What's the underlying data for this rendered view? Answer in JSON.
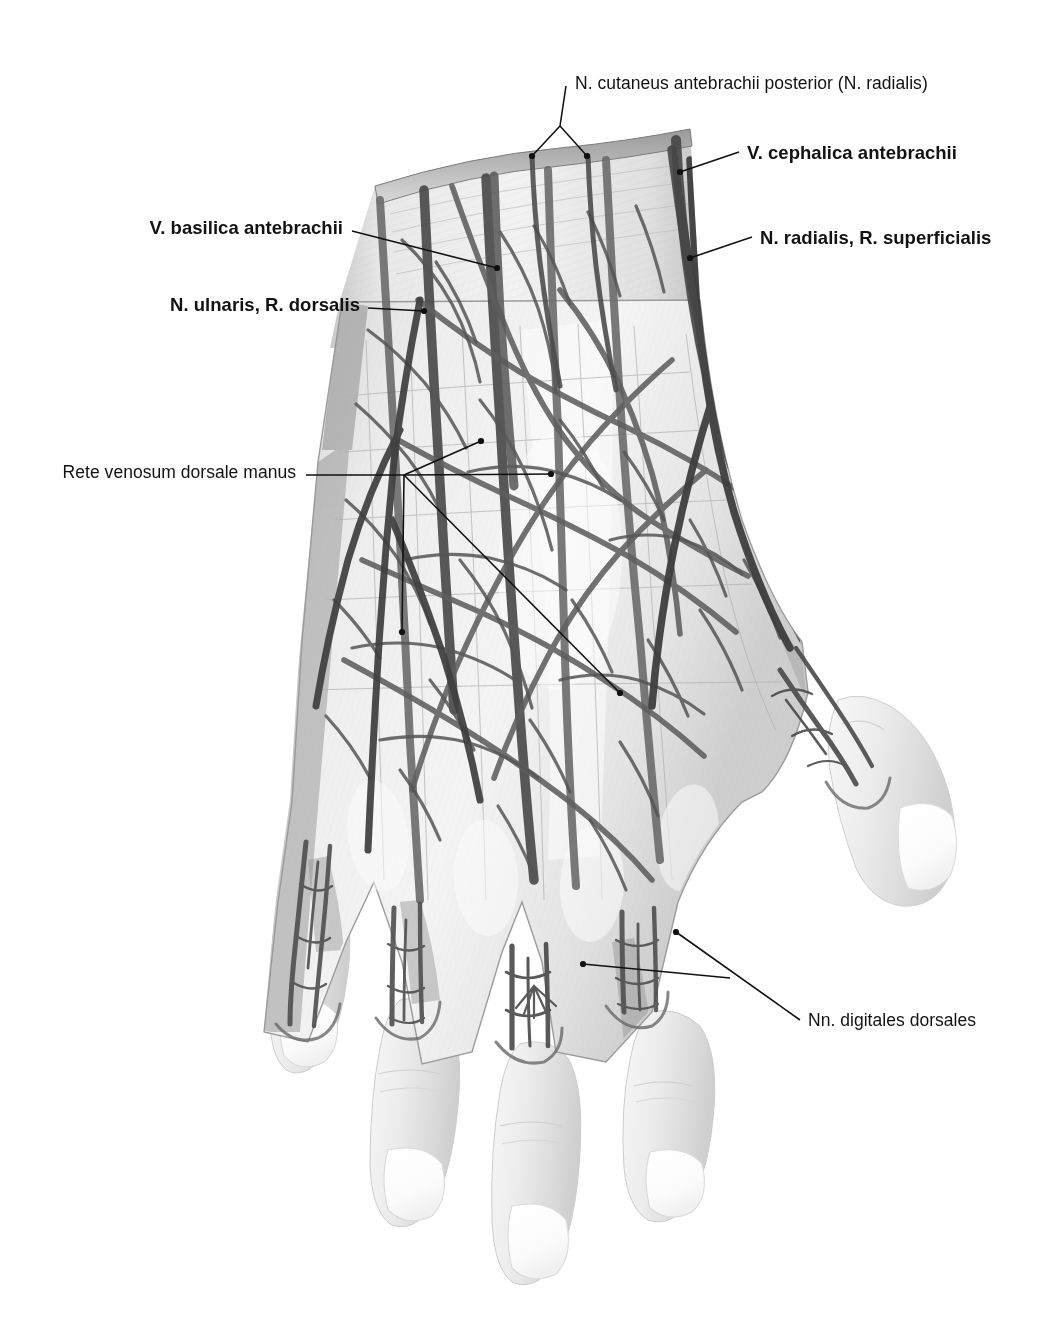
{
  "figure": {
    "view": "dorsal view of right hand, skin removed proximally",
    "style": "grayscale anatomical illustration",
    "background_color": "#ffffff",
    "ink_color": "#121212"
  },
  "labels": [
    {
      "id": "n-cutaneus-antebrachii-posterior",
      "text": "N. cutaneus antebrachii posterior (N. radialis)",
      "weight": "regular",
      "align": "left",
      "x": 575,
      "y": 74
    },
    {
      "id": "v-cephalica-antebrachii",
      "text": "V. cephalica antebrachii",
      "weight": "bold",
      "align": "left",
      "x": 747,
      "y": 143
    },
    {
      "id": "v-basilica-antebrachii",
      "text": "V. basilica antebrachii",
      "weight": "bold",
      "align": "right",
      "x": 343,
      "y": 218
    },
    {
      "id": "n-radialis-r-superficialis",
      "text": "N. radialis, R. superficialis",
      "weight": "bold",
      "align": "left",
      "x": 760,
      "y": 228
    },
    {
      "id": "n-ulnaris-r-dorsalis",
      "text": "N. ulnaris, R. dorsalis",
      "weight": "bold",
      "align": "right",
      "x": 360,
      "y": 295
    },
    {
      "id": "rete-venosum-dorsale-manus",
      "text": "Rete venosum dorsale manus",
      "weight": "regular",
      "align": "right",
      "x": 296,
      "y": 463
    },
    {
      "id": "nn-digitales-dorsales",
      "text": "Nn. digitales dorsales",
      "weight": "regular",
      "align": "left",
      "x": 808,
      "y": 1011
    }
  ],
  "leaders": [
    {
      "id": "leader-n-cutaneus-antebrachii-posterior",
      "for": "n-cutaneus-antebrachii-posterior",
      "branches": [
        "M 566,86 L 560,126",
        "M 560,126 L 532,156",
        "M 560,126 L 587,156"
      ],
      "dots": [
        [
          532,
          156
        ],
        [
          587,
          156
        ]
      ]
    },
    {
      "id": "leader-v-cephalica-antebrachii",
      "for": "v-cephalica-antebrachii",
      "branches": [
        "M 739,152 L 680,172"
      ],
      "dots": [
        [
          680,
          172
        ]
      ]
    },
    {
      "id": "leader-v-basilica-antebrachii",
      "for": "v-basilica-antebrachii",
      "branches": [
        "M 352,231 L 497,268"
      ],
      "dots": [
        [
          497,
          268
        ]
      ]
    },
    {
      "id": "leader-n-radialis-r-superficialis",
      "for": "n-radialis-r-superficialis",
      "branches": [
        "M 752,237 L 690,258"
      ],
      "dots": [
        [
          690,
          258
        ]
      ]
    },
    {
      "id": "leader-n-ulnaris-r-dorsalis",
      "for": "n-ulnaris-r-dorsalis",
      "branches": [
        "M 368,308 L 424,311"
      ],
      "dots": [
        [
          424,
          311
        ]
      ]
    },
    {
      "id": "leader-rete-venosum-dorsale-manus",
      "for": "rete-venosum-dorsale-manus",
      "branches": [
        "M 306,475 L 404,475",
        "M 404,475 L 481,441",
        "M 404,475 L 551,474",
        "M 404,475 L 620,693",
        "M 404,475 L 402,632"
      ],
      "dots": [
        [
          481,
          441
        ],
        [
          551,
          474
        ],
        [
          620,
          693
        ],
        [
          402,
          632
        ]
      ]
    },
    {
      "id": "leader-nn-digitales-dorsales",
      "for": "nn-digitales-dorsales",
      "branches": [
        "M 800,1020 L 676,932",
        "M 730,978 L 583,964"
      ],
      "dots": [
        [
          676,
          932
        ],
        [
          583,
          964
        ]
      ]
    }
  ],
  "anatomy": {
    "structures": [
      "N. cutaneus antebrachii posterior (N. radialis)",
      "V. cephalica antebrachii",
      "V. basilica antebrachii",
      "N. radialis, R. superficialis",
      "N. ulnaris, R. dorsalis",
      "Rete venosum dorsale manus",
      "Nn. digitales dorsales"
    ],
    "digits": [
      "thumb",
      "index",
      "middle",
      "ring",
      "little"
    ]
  }
}
